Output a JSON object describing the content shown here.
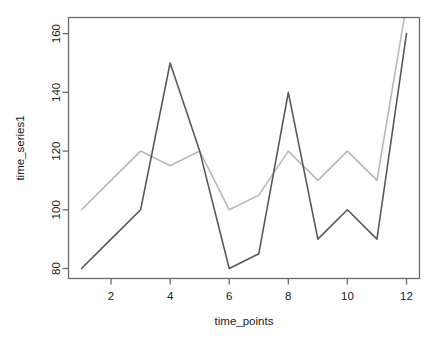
{
  "chart_data": {
    "type": "line",
    "title": "",
    "xlabel": "time_points",
    "ylabel": "time_series1",
    "x": [
      1,
      2,
      3,
      4,
      5,
      6,
      7,
      8,
      9,
      10,
      11,
      12
    ],
    "series": [
      {
        "name": "series-dark",
        "color": "#595959",
        "values": [
          80,
          90,
          100,
          150,
          120,
          80,
          85,
          140,
          90,
          100,
          90,
          160
        ]
      },
      {
        "name": "series-light",
        "color": "#b9b9b9",
        "values": [
          100,
          110,
          120,
          115,
          120,
          100,
          105,
          120,
          110,
          120,
          110,
          170
        ]
      }
    ],
    "xlim": [
      0.56,
      12.44
    ],
    "ylim": [
      76.6,
      165.5
    ],
    "xticks": [
      2,
      4,
      6,
      8,
      10,
      12
    ],
    "xtick_labels": [
      "2",
      "4",
      "6",
      "8",
      "10",
      "12"
    ],
    "yticks": [
      80,
      100,
      120,
      140,
      160
    ],
    "ytick_labels": [
      "80",
      "100",
      "120",
      "140",
      "160"
    ],
    "grid": false,
    "legend": "none",
    "box": true,
    "ytick_label_rotation": -90,
    "clipped_top": true
  },
  "axes": {
    "frame_color": "#6b6b6b",
    "tick_color": "#6b6b6b",
    "label_color": "#1a1a1a",
    "background": "#ffffff"
  }
}
